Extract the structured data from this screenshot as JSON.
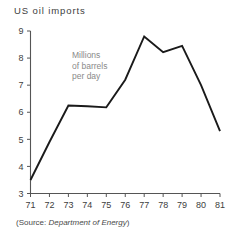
{
  "chart_data": {
    "type": "line",
    "title": "US  oil  imports",
    "xlabel": "",
    "ylabel": "",
    "annotation": [
      "Millions",
      "of barrels",
      "per day"
    ],
    "source_prefix": "(Source: ",
    "source_name": "Department of Energy",
    "source_suffix": ")",
    "x": [
      71,
      72,
      73,
      74,
      75,
      76,
      77,
      78,
      79,
      80,
      81
    ],
    "xtick_labels": [
      "71",
      "72",
      "73",
      "74",
      "75",
      "76",
      "77",
      "78",
      "79",
      "80",
      "81"
    ],
    "values": [
      3.5,
      4.9,
      6.25,
      6.22,
      6.18,
      7.2,
      8.8,
      8.22,
      8.45,
      7.0,
      5.3
    ],
    "ytick_labels": [
      "3",
      "4",
      "5",
      "6",
      "7",
      "8",
      "9"
    ],
    "yticks": [
      3,
      4,
      5,
      6,
      7,
      8,
      9
    ],
    "xlim": [
      71,
      81
    ],
    "ylim": [
      3,
      9
    ],
    "grid": false,
    "legend": "none",
    "line_color": "#1a1a1a",
    "axis_color": "#555555",
    "annotation_color": "#8a8a8a",
    "background": "#ffffff"
  }
}
